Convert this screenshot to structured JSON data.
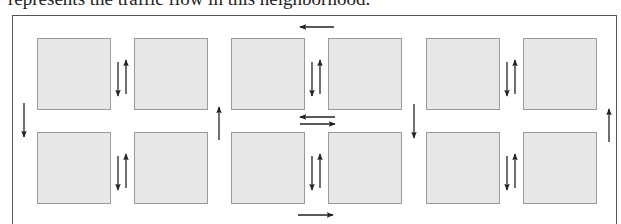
{
  "caption": "represents the traffic flow in this neighborhood.",
  "colors": {
    "block_fill": "#e8e8e8",
    "block_border": "#9a9a9a",
    "arrow": "#222222",
    "frame": "#555555"
  },
  "blocks": [
    {
      "id": "block-r1-c1",
      "x": 37,
      "y": 38,
      "w": 74,
      "h": 72
    },
    {
      "id": "block-r1-c2",
      "x": 134,
      "y": 38,
      "w": 74,
      "h": 72
    },
    {
      "id": "block-r1-c3",
      "x": 231,
      "y": 38,
      "w": 74,
      "h": 72
    },
    {
      "id": "block-r1-c4",
      "x": 328,
      "y": 38,
      "w": 74,
      "h": 72
    },
    {
      "id": "block-r1-c5",
      "x": 426,
      "y": 38,
      "w": 74,
      "h": 72
    },
    {
      "id": "block-r1-c6",
      "x": 523,
      "y": 38,
      "w": 74,
      "h": 72
    },
    {
      "id": "block-r2-c1",
      "x": 37,
      "y": 132,
      "w": 74,
      "h": 72
    },
    {
      "id": "block-r2-c2",
      "x": 134,
      "y": 132,
      "w": 74,
      "h": 72
    },
    {
      "id": "block-r2-c3",
      "x": 231,
      "y": 132,
      "w": 74,
      "h": 72
    },
    {
      "id": "block-r2-c4",
      "x": 328,
      "y": 132,
      "w": 74,
      "h": 72
    },
    {
      "id": "block-r2-c5",
      "x": 426,
      "y": 132,
      "w": 74,
      "h": 72
    },
    {
      "id": "block-r2-c6",
      "x": 523,
      "y": 132,
      "w": 74,
      "h": 72
    }
  ],
  "arrows": [
    {
      "name": "top-street-west-arrow",
      "dir": "left",
      "x1": 334,
      "y1": 27,
      "x2": 300,
      "y2": 27
    },
    {
      "name": "middle-street-west-arrow",
      "dir": "left",
      "x1": 335,
      "y1": 117,
      "x2": 300,
      "y2": 117
    },
    {
      "name": "middle-street-east-arrow",
      "dir": "right",
      "x1": 300,
      "y1": 124,
      "x2": 335,
      "y2": 124
    },
    {
      "name": "bottom-street-east-arrow",
      "dir": "right",
      "x1": 298,
      "y1": 215,
      "x2": 333,
      "y2": 215
    },
    {
      "name": "left-avenue-south-arrow",
      "dir": "down",
      "x1": 24,
      "y1": 103,
      "x2": 24,
      "y2": 137
    },
    {
      "name": "avenue-2-north-arrow",
      "dir": "up",
      "x1": 219,
      "y1": 140,
      "x2": 219,
      "y2": 107
    },
    {
      "name": "avenue-4-south-arrow",
      "dir": "down",
      "x1": 414,
      "y1": 104,
      "x2": 414,
      "y2": 138
    },
    {
      "name": "right-avenue-north-arrow",
      "dir": "up",
      "x1": 609,
      "y1": 142,
      "x2": 609,
      "y2": 109
    },
    {
      "name": "alley-1-top-south-arrow",
      "dir": "down",
      "x1": 118,
      "y1": 62,
      "x2": 118,
      "y2": 96
    },
    {
      "name": "alley-1-top-north-arrow",
      "dir": "up",
      "x1": 126,
      "y1": 94,
      "x2": 126,
      "y2": 60
    },
    {
      "name": "alley-3-top-south-arrow",
      "dir": "down",
      "x1": 312,
      "y1": 62,
      "x2": 312,
      "y2": 96
    },
    {
      "name": "alley-3-top-north-arrow",
      "dir": "up",
      "x1": 320,
      "y1": 94,
      "x2": 320,
      "y2": 60
    },
    {
      "name": "alley-5-top-south-arrow",
      "dir": "down",
      "x1": 507,
      "y1": 62,
      "x2": 507,
      "y2": 96
    },
    {
      "name": "alley-5-top-north-arrow",
      "dir": "up",
      "x1": 515,
      "y1": 94,
      "x2": 515,
      "y2": 60
    },
    {
      "name": "alley-1-bottom-south-arrow",
      "dir": "down",
      "x1": 118,
      "y1": 156,
      "x2": 118,
      "y2": 190
    },
    {
      "name": "alley-1-bottom-north-arrow",
      "dir": "up",
      "x1": 126,
      "y1": 188,
      "x2": 126,
      "y2": 154
    },
    {
      "name": "alley-3-bottom-south-arrow",
      "dir": "down",
      "x1": 312,
      "y1": 156,
      "x2": 312,
      "y2": 190
    },
    {
      "name": "alley-3-bottom-north-arrow",
      "dir": "up",
      "x1": 320,
      "y1": 188,
      "x2": 320,
      "y2": 154
    },
    {
      "name": "alley-5-bottom-south-arrow",
      "dir": "down",
      "x1": 507,
      "y1": 156,
      "x2": 507,
      "y2": 190
    },
    {
      "name": "alley-5-bottom-north-arrow",
      "dir": "up",
      "x1": 515,
      "y1": 188,
      "x2": 515,
      "y2": 154
    }
  ]
}
